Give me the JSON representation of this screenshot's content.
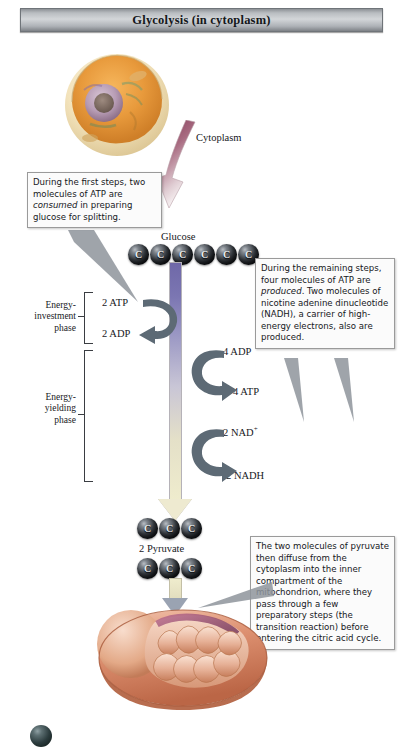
{
  "title": {
    "text": "Glycolysis (in cytoplasm)"
  },
  "labels": {
    "cytoplasm": "Cytoplasm",
    "glucose": "Glucose",
    "pyruvate": "2 Pyruvate",
    "atp_in": "2 ATP",
    "adp_in": "2 ADP",
    "adp_out": "4 ADP",
    "atp_out": "4 ATP",
    "nad_plus": "2 NAD",
    "nad_plus_sup": "+",
    "nadh": "2 NADH"
  },
  "phases": {
    "investment": "Energy-\ninvestment\nphase",
    "investment_line1": "Energy-",
    "investment_line2": "investment",
    "investment_line3": "phase",
    "yielding_line1": "Energy-",
    "yielding_line2": "yielding",
    "yielding_line3": "phase"
  },
  "callouts": {
    "investment": {
      "part1": "During the first steps, two molecules of ATP are ",
      "emph": "consumed",
      "part2": " in preparing glucose for splitting."
    },
    "yielding": {
      "part1": "During the remaining steps, four molecules of ATP are ",
      "emph": "produced",
      "part2": ". Two molecules of nicotine adenine dinucleotide (NADH), a carrier of high-energy electrons, also are produced."
    },
    "pyruvate": {
      "text": "The two molecules of pyruvate then diffuse from the cytoplasm into the inner compartment of the mitochondrion, where they pass through a few preparatory steps (the transition reaction) before entering the citric acid cycle."
    }
  },
  "molecules": {
    "glucose_carbons": [
      "C",
      "C",
      "C",
      "C",
      "C",
      "C"
    ],
    "pyruvate_row1": [
      "C",
      "C",
      "C"
    ],
    "pyruvate_row2": [
      "C",
      "C",
      "C"
    ]
  },
  "colors": {
    "banner_mid": "#d3d6d9",
    "banner_edge": "#7e8287",
    "flow_top": "#6f68a8",
    "flow_bottom": "#efeccd",
    "arrow_gray": "#5d6a75",
    "cytoplasm_pointer": "#8e3f5c",
    "cell_body": "#e9a552",
    "mito_body": "#d4876b"
  }
}
